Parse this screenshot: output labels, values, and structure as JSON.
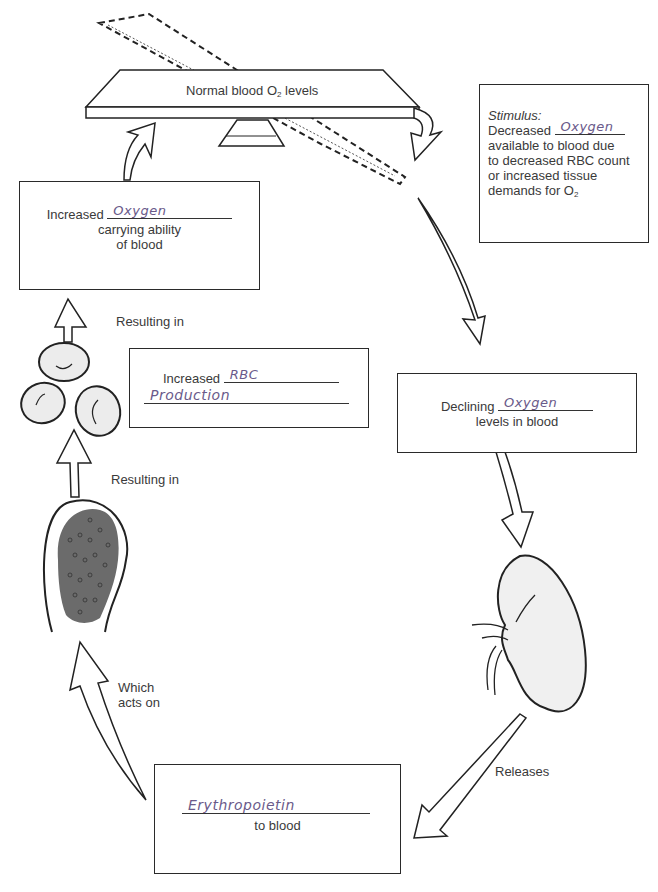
{
  "diagram": {
    "balance": {
      "label_pre": "Normal blood O",
      "label_sub": "2",
      "label_post": " levels"
    },
    "stimulus": {
      "heading": "Stimulus:",
      "line1_pre": "Decreased",
      "line1_answer": "Oxygen",
      "line2": "available to blood due",
      "line3": "to decreased RBC count",
      "line4": "or increased tissue",
      "line5_pre": "demands for O",
      "line5_sub": "2"
    },
    "declining": {
      "pre": "Declining",
      "answer": "Oxygen",
      "post": "levels in blood"
    },
    "releases_label": "Releases",
    "epo": {
      "answer": "Erythropoietin",
      "post": "to blood"
    },
    "acts_on_label_1": "Which",
    "acts_on_label_2": "acts on",
    "resulting_in_lower": "Resulting in",
    "rbc": {
      "pre": "Increased",
      "answer1": "RBC",
      "answer2": "Production"
    },
    "resulting_in_upper": "Resulting in",
    "carrying": {
      "pre": "Increased",
      "answer": "Oxygen",
      "line2": "carrying ability",
      "line3": "of blood"
    },
    "colors": {
      "ink": "#2a2a2a",
      "handwriting": "#6a5a8a",
      "organ_fill": "#eeeeee",
      "marrow_fill": "#6b6b6b"
    }
  }
}
